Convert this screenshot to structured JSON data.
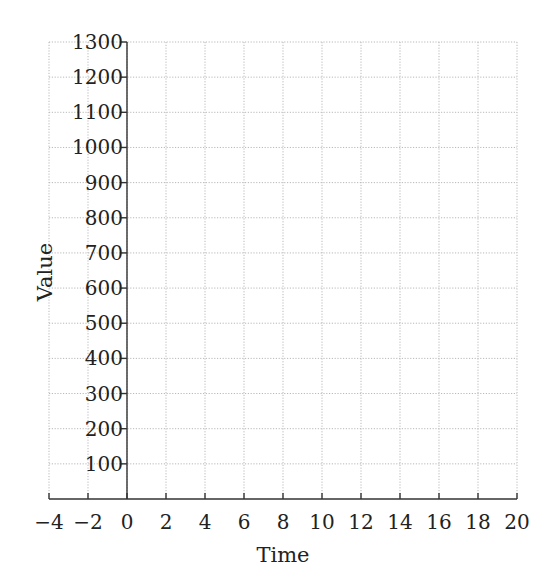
{
  "chart_data": {
    "type": "line",
    "title": "",
    "xlabel": "Time",
    "ylabel": "Value",
    "xlim": [
      -4,
      20
    ],
    "ylim": [
      0,
      1300
    ],
    "x_ticks": [
      -4,
      -2,
      0,
      2,
      4,
      6,
      8,
      10,
      12,
      14,
      16,
      18,
      20
    ],
    "x_tick_labels": [
      "−4",
      "−2",
      "0",
      "2",
      "4",
      "6",
      "8",
      "10",
      "12",
      "14",
      "16",
      "18",
      "20"
    ],
    "y_ticks": [
      100,
      200,
      300,
      400,
      500,
      600,
      700,
      800,
      900,
      1000,
      1100,
      1200,
      1300
    ],
    "y_tick_labels": [
      "100",
      "200",
      "300",
      "400",
      "500",
      "600",
      "700",
      "800",
      "900",
      "1000",
      "1100",
      "1200",
      "1300"
    ],
    "grid": true,
    "grid_style": "dotted",
    "y_axis_at_x": 0,
    "x_axis_at_y": 0,
    "series": [],
    "legend": null
  },
  "colors": {
    "grid": "#b8b8b8",
    "axis": "#333333",
    "text": "#222222",
    "background": "#ffffff"
  }
}
